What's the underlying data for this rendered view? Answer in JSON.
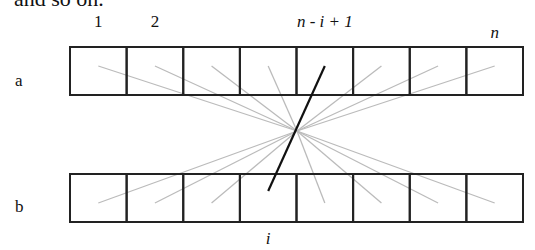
{
  "caption_fragment": "and so on.",
  "rows": [
    {
      "name": "a",
      "cells": 8
    },
    {
      "name": "b",
      "cells": 8
    }
  ],
  "top_labels": [
    {
      "text": "1",
      "cell": 1,
      "italic": false
    },
    {
      "text": "2",
      "cell": 2,
      "italic": false
    },
    {
      "text": "n - i + 1",
      "cell": 5,
      "italic": true
    },
    {
      "text": "n",
      "cell": 8,
      "italic": true
    }
  ],
  "bottom_labels": [
    {
      "text": "i",
      "cell": 4,
      "italic": true
    }
  ],
  "connections": {
    "description": "Each cell j of array a is connected to cell n-j+1 of array b through a common crossing point; one highlighted connection from a[n-i+1] to b[i].",
    "gray_lines_from_a": [
      1,
      2,
      3,
      4,
      6,
      7,
      8
    ],
    "gray_lines_to_b": [
      1,
      2,
      3,
      5,
      6,
      7,
      8
    ],
    "highlighted": {
      "from_a_cell": 5,
      "to_b_cell": 4
    }
  },
  "colors": {
    "box_stroke": "#222222",
    "gray_line": "#bbbbbb",
    "highlight_line": "#111111",
    "text": "#111111"
  }
}
